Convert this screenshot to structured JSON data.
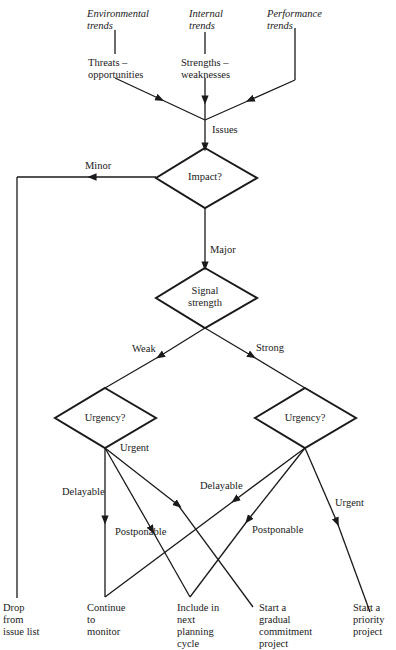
{
  "inputs": [
    {
      "source": "Environmental trends",
      "derived": "Threats – opportunities"
    },
    {
      "source": "Internal trends",
      "derived": "Strengths – weaknesses"
    },
    {
      "source": "Performance trends",
      "derived": ""
    }
  ],
  "labels": {
    "env_line1": "Environmental",
    "env_line2": "trends",
    "int_line1": "Internal",
    "int_line2": "trends",
    "perf_line1": "Performance",
    "perf_line2": "trends",
    "threats_line1": "Threats –",
    "threats_line2": "opportunities",
    "strengths_line1": "Strengths –",
    "strengths_line2": "weaknesses",
    "issues": "Issues",
    "minor": "Minor",
    "major": "Major",
    "weak": "Weak",
    "strong": "Strong",
    "urgent_left": "Urgent",
    "delayable_left": "Delayable",
    "postponable_left": "Postponable",
    "delayable_right": "Delayable",
    "postponable_right": "Postponable",
    "urgent_right": "Urgent"
  },
  "decisions": {
    "impact": "Impact?",
    "signal_line1": "Signal",
    "signal_line2": "strength",
    "urgency_left": "Urgency?",
    "urgency_right": "Urgency?"
  },
  "outcomes": {
    "drop": [
      "Drop",
      "from",
      "issue list"
    ],
    "monitor": [
      "Continue",
      "to",
      "monitor"
    ],
    "include": [
      "Include in",
      "next",
      "planning",
      "cycle"
    ],
    "gradual": [
      "Start a",
      "gradual",
      "commitment",
      "project"
    ],
    "priority": [
      "Start a",
      "priority",
      "project"
    ]
  },
  "colors": {
    "line": "#1a1a1a",
    "background": "#ffffff"
  }
}
